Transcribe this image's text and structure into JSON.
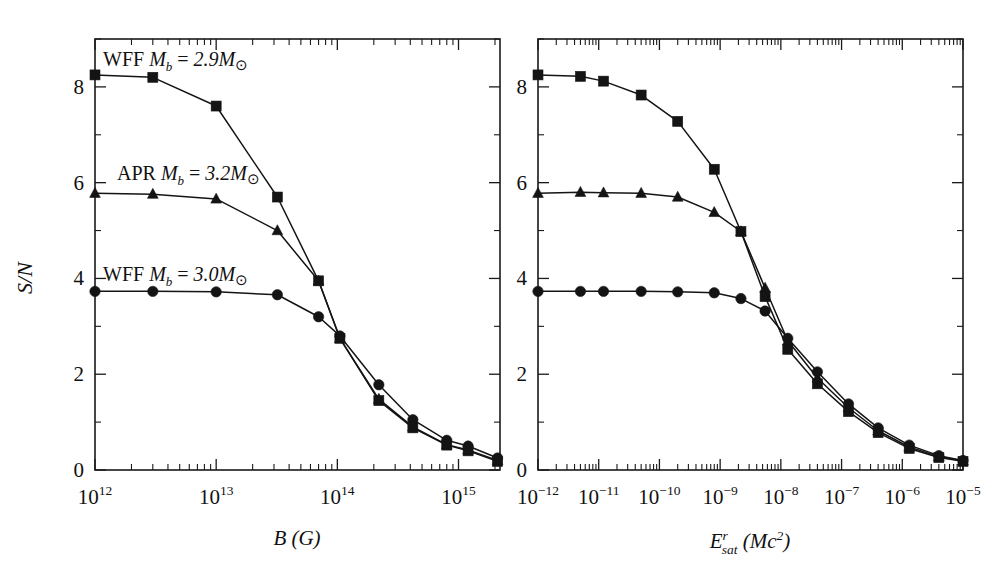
{
  "figure": {
    "ylabel": "S/N",
    "panels": [
      {
        "id": "left",
        "xlabel_main": "B",
        "xlabel_unit": "(G)",
        "x_ticks": [
          "10",
          "10",
          "10",
          "10"
        ],
        "x_tick_exponents": [
          "12",
          "13",
          "14",
          "15"
        ],
        "y_ticks": [
          "0",
          "2",
          "4",
          "6",
          "8"
        ],
        "annotations": [
          {
            "text_roman": "WFF ",
            "text_m": "M",
            "text_sub": "b",
            "text_eq": " = ",
            "text_val": "2.9M",
            "text_sun": "⊙"
          },
          {
            "text_roman": "APR ",
            "text_m": "M",
            "text_sub": "b",
            "text_eq": " = ",
            "text_val": "3.2M",
            "text_sun": "⊙"
          },
          {
            "text_roman": "WFF ",
            "text_m": "M",
            "text_sub": "b",
            "text_eq": " = ",
            "text_val": "3.0M",
            "text_sun": "⊙"
          }
        ]
      },
      {
        "id": "right",
        "xlabel_main": "E",
        "xlabel_sup": "r",
        "xlabel_sub": "sat",
        "xlabel_unit_open": " (Mc",
        "xlabel_unit_sup": "2",
        "xlabel_unit_close": ")",
        "x_ticks": [
          "10",
          "10",
          "10",
          "10",
          "10",
          "10",
          "10",
          "10"
        ],
        "x_tick_exponents": [
          "−12",
          "−11",
          "−10",
          "−9",
          "−8",
          "−7",
          "−6",
          "−5"
        ],
        "y_ticks": [
          "0",
          "2",
          "4",
          "6",
          "8"
        ]
      }
    ]
  },
  "chart_data": [
    {
      "type": "line",
      "panel": "left",
      "title": "",
      "xlabel": "B (G)",
      "ylabel": "S/N",
      "xscale": "log",
      "xlim": [
        1000000000000.0,
        2200000000000000.0
      ],
      "ylim": [
        0,
        9.0
      ],
      "grid": false,
      "legend_position": "inline-annotations",
      "yticks": [
        0,
        2,
        4,
        6,
        8
      ],
      "xticks": [
        1000000000000.0,
        10000000000000.0,
        100000000000000.0,
        1000000000000000.0
      ],
      "series": [
        {
          "name": "WFF M_b = 2.9 Msun",
          "marker": "square",
          "x": [
            1000000000000.0,
            3000000000000.0,
            10000000000000.0,
            32000000000000.0,
            70000000000000.0,
            105000000000000.0,
            220000000000000.0,
            420000000000000.0,
            800000000000000.0,
            1200000000000000.0,
            2100000000000000.0
          ],
          "y": [
            8.25,
            8.2,
            7.6,
            5.7,
            3.95,
            2.75,
            1.45,
            0.88,
            0.52,
            0.4,
            0.18
          ]
        },
        {
          "name": "APR M_b = 3.2 Msun",
          "marker": "triangle",
          "x": [
            1000000000000.0,
            3000000000000.0,
            10000000000000.0,
            32000000000000.0,
            70000000000000.0,
            105000000000000.0,
            220000000000000.0,
            420000000000000.0,
            800000000000000.0,
            1200000000000000.0,
            2100000000000000.0
          ],
          "y": [
            5.78,
            5.76,
            5.66,
            5.0,
            3.95,
            2.75,
            1.48,
            0.9,
            0.53,
            0.42,
            0.2
          ]
        },
        {
          "name": "WFF M_b = 3.0 Msun",
          "marker": "circle",
          "x": [
            1000000000000.0,
            3000000000000.0,
            10000000000000.0,
            32000000000000.0,
            70000000000000.0,
            105000000000000.0,
            220000000000000.0,
            420000000000000.0,
            800000000000000.0,
            1200000000000000.0,
            2100000000000000.0
          ],
          "y": [
            3.73,
            3.73,
            3.72,
            3.66,
            3.2,
            2.8,
            1.78,
            1.05,
            0.62,
            0.5,
            0.25
          ]
        }
      ]
    },
    {
      "type": "line",
      "panel": "right",
      "title": "",
      "xlabel": "E^r_sat (Mc^2)",
      "ylabel": "S/N",
      "xscale": "log",
      "xlim": [
        1e-12,
        1e-05
      ],
      "ylim": [
        0,
        9.0
      ],
      "grid": false,
      "legend_position": "none",
      "yticks": [
        0,
        2,
        4,
        6,
        8
      ],
      "xticks": [
        1e-12,
        1e-11,
        1e-10,
        1e-09,
        1e-08,
        1e-07,
        1e-06,
        1e-05
      ],
      "series": [
        {
          "name": "WFF M_b = 2.9 Msun",
          "marker": "square",
          "x": [
            1e-12,
            5e-12,
            1.2e-11,
            5e-11,
            2e-10,
            8e-10,
            2.2e-09,
            5.5e-09,
            1.3e-08,
            4e-08,
            1.3e-07,
            4e-07,
            1.3e-06,
            4e-06,
            1e-05
          ],
          "y": [
            8.25,
            8.22,
            8.12,
            7.83,
            7.28,
            6.28,
            4.98,
            3.62,
            2.52,
            1.8,
            1.22,
            0.78,
            0.45,
            0.26,
            0.18
          ]
        },
        {
          "name": "APR M_b = 3.2 Msun",
          "marker": "triangle",
          "x": [
            1e-12,
            5e-12,
            1.2e-11,
            5e-11,
            2e-10,
            8e-10,
            2.2e-09,
            5.5e-09,
            1.3e-08,
            4e-08,
            1.3e-07,
            4e-07,
            1.3e-06,
            4e-06,
            1e-05
          ],
          "y": [
            5.78,
            5.8,
            5.79,
            5.78,
            5.7,
            5.38,
            4.98,
            3.8,
            2.7,
            1.92,
            1.3,
            0.82,
            0.48,
            0.28,
            0.19
          ]
        },
        {
          "name": "WFF M_b = 3.0 Msun",
          "marker": "circle",
          "x": [
            1e-12,
            5e-12,
            1.2e-11,
            5e-11,
            2e-10,
            8e-10,
            2.2e-09,
            5.5e-09,
            1.3e-08,
            4e-08,
            1.3e-07,
            4e-07,
            1.3e-06,
            4e-06,
            1e-05
          ],
          "y": [
            3.73,
            3.73,
            3.73,
            3.73,
            3.72,
            3.7,
            3.58,
            3.32,
            2.75,
            2.05,
            1.38,
            0.88,
            0.52,
            0.3,
            0.2
          ]
        }
      ]
    }
  ]
}
